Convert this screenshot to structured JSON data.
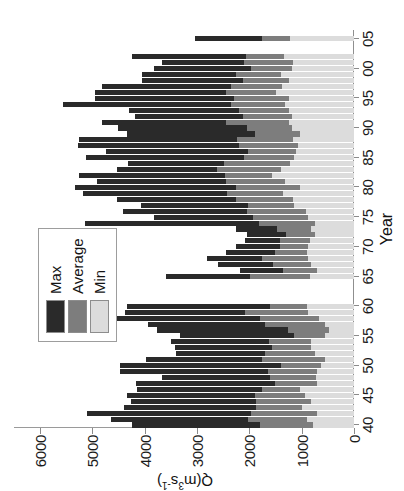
{
  "figure": {
    "ylabel_main": "Q",
    "ylabel_unit_open": "(m",
    "ylabel_exp1": "3",
    "ylabel_s": "s",
    "ylabel_exp2": "-1",
    "ylabel_unit_close": ")",
    "xlabel": "Year"
  },
  "legend": {
    "position": "top-left-inside",
    "items": [
      {
        "label": "Max",
        "color": "#2a2a2a"
      },
      {
        "label": "Average",
        "color": "#7d7d7d"
      },
      {
        "label": "Min",
        "color": "#dcdcdc"
      }
    ]
  },
  "chart_data": {
    "type": "bar",
    "orientation": "rotated-90ccw-horizontal-bars",
    "title": "",
    "subtitle": "",
    "xlabel": "Year",
    "ylabel": "Q (m3 s-1)",
    "ylim": [
      0,
      6500
    ],
    "xlim": [
      1939.5,
      2006.5
    ],
    "grid": false,
    "legend_position": "top-left-inside",
    "ytick_labels": [
      "6000",
      "5000",
      "4000",
      "3000",
      "2000",
      "1000",
      "0"
    ],
    "ytick_values": [
      6000,
      5000,
      4000,
      3000,
      2000,
      1000,
      0
    ],
    "xtick_labels": [
      "40",
      "45",
      "50",
      "55",
      "60",
      "65",
      "70",
      "75",
      "80",
      "85",
      "90",
      "95",
      "00",
      "05"
    ],
    "xtick_values": [
      1940,
      1945,
      1950,
      1955,
      1960,
      1965,
      1970,
      1975,
      1980,
      1985,
      1990,
      1995,
      2000,
      2005
    ],
    "annotations": [
      "data gap for years 1961-1964",
      "no data for 2003-2004 and 2006"
    ],
    "series": [
      {
        "name": "Max",
        "color": "#2a2a2a"
      },
      {
        "name": "Average",
        "color": "#7d7d7d"
      },
      {
        "name": "Min",
        "color": "#dcdcdc"
      }
    ],
    "categories": [
      1940,
      1941,
      1942,
      1943,
      1944,
      1945,
      1946,
      1947,
      1948,
      1949,
      1950,
      1951,
      1952,
      1953,
      1954,
      1955,
      1956,
      1957,
      1958,
      1959,
      1960,
      1965,
      1966,
      1967,
      1968,
      1969,
      1970,
      1971,
      1972,
      1973,
      1974,
      1975,
      1976,
      1977,
      1978,
      1979,
      1980,
      1981,
      1982,
      1983,
      1984,
      1985,
      1986,
      1987,
      1988,
      1989,
      1990,
      1991,
      1992,
      1993,
      1994,
      1995,
      1996,
      1997,
      1998,
      1999,
      2000,
      2001,
      2002,
      2005
    ],
    "records": [
      {
        "year": 1940,
        "max": 4250,
        "avg": 1800,
        "min": 780
      },
      {
        "year": 1941,
        "max": 4640,
        "avg": 2020,
        "min": 900
      },
      {
        "year": 1942,
        "max": 5100,
        "avg": 1960,
        "min": 700
      },
      {
        "year": 1943,
        "max": 4400,
        "avg": 1880,
        "min": 1000
      },
      {
        "year": 1944,
        "max": 4260,
        "avg": 1870,
        "min": 820
      },
      {
        "year": 1945,
        "max": 4340,
        "avg": 1900,
        "min": 940
      },
      {
        "year": 1946,
        "max": 4150,
        "avg": 1760,
        "min": 1030
      },
      {
        "year": 1947,
        "max": 4170,
        "avg": 1520,
        "min": 700
      },
      {
        "year": 1948,
        "max": 3680,
        "avg": 1600,
        "min": 720
      },
      {
        "year": 1949,
        "max": 4480,
        "avg": 1640,
        "min": 700
      },
      {
        "year": 1950,
        "max": 4470,
        "avg": 1400,
        "min": 640
      },
      {
        "year": 1951,
        "max": 3980,
        "avg": 1760,
        "min": 560
      },
      {
        "year": 1952,
        "max": 3400,
        "avg": 1700,
        "min": 740
      },
      {
        "year": 1953,
        "max": 3420,
        "avg": 1560,
        "min": 820
      },
      {
        "year": 1954,
        "max": 3500,
        "avg": 1620,
        "min": 820
      },
      {
        "year": 1955,
        "max": 3320,
        "avg": 1140,
        "min": 560
      },
      {
        "year": 1956,
        "max": 3760,
        "avg": 1260,
        "min": 480
      },
      {
        "year": 1957,
        "max": 3940,
        "avg": 1700,
        "min": 560
      },
      {
        "year": 1958,
        "max": 5060,
        "avg": 1800,
        "min": 660
      },
      {
        "year": 1959,
        "max": 4380,
        "avg": 2080,
        "min": 880
      },
      {
        "year": 1960,
        "max": 4340,
        "avg": 1600,
        "min": 900
      },
      {
        "year": 1965,
        "max": 3600,
        "avg": 1980,
        "min": 840
      },
      {
        "year": 1966,
        "max": 2180,
        "avg": 1360,
        "min": 700
      },
      {
        "year": 1967,
        "max": 2600,
        "avg": 1540,
        "min": 820
      },
      {
        "year": 1968,
        "max": 2820,
        "avg": 1760,
        "min": 880
      },
      {
        "year": 1969,
        "max": 2440,
        "avg": 1520,
        "min": 900
      },
      {
        "year": 1970,
        "max": 2260,
        "avg": 1420,
        "min": 880
      },
      {
        "year": 1971,
        "max": 2080,
        "avg": 1420,
        "min": 840
      },
      {
        "year": 1972,
        "max": 2040,
        "avg": 1300,
        "min": 740
      },
      {
        "year": 1973,
        "max": 2260,
        "avg": 1480,
        "min": 820
      },
      {
        "year": 1974,
        "max": 5140,
        "avg": 1820,
        "min": 740
      },
      {
        "year": 1975,
        "max": 3820,
        "avg": 1940,
        "min": 880
      },
      {
        "year": 1976,
        "max": 4420,
        "avg": 2040,
        "min": 920
      },
      {
        "year": 1977,
        "max": 4080,
        "avg": 2020,
        "min": 1140
      },
      {
        "year": 1978,
        "max": 4540,
        "avg": 2260,
        "min": 1160
      },
      {
        "year": 1979,
        "max": 5180,
        "avg": 2420,
        "min": 1360
      },
      {
        "year": 1980,
        "max": 5340,
        "avg": 2260,
        "min": 1040
      },
      {
        "year": 1981,
        "max": 4920,
        "avg": 2440,
        "min": 1320
      },
      {
        "year": 1982,
        "max": 5260,
        "avg": 2460,
        "min": 1560
      },
      {
        "year": 1983,
        "max": 4540,
        "avg": 2620,
        "min": 1400
      },
      {
        "year": 1984,
        "max": 4320,
        "avg": 2480,
        "min": 1220
      },
      {
        "year": 1985,
        "max": 5120,
        "avg": 2100,
        "min": 1140
      },
      {
        "year": 1986,
        "max": 4740,
        "avg": 2020,
        "min": 1100
      },
      {
        "year": 1987,
        "max": 5280,
        "avg": 2200,
        "min": 1080
      },
      {
        "year": 1988,
        "max": 5260,
        "avg": 2240,
        "min": 1160
      },
      {
        "year": 1989,
        "max": 4340,
        "avg": 1900,
        "min": 1040
      },
      {
        "year": 1990,
        "max": 4520,
        "avg": 2040,
        "min": 1180
      },
      {
        "year": 1991,
        "max": 4820,
        "avg": 2440,
        "min": 1240
      },
      {
        "year": 1992,
        "max": 4180,
        "avg": 2120,
        "min": 1180
      },
      {
        "year": 1993,
        "max": 4300,
        "avg": 2200,
        "min": 1240
      },
      {
        "year": 1994,
        "max": 5560,
        "avg": 2360,
        "min": 1320
      },
      {
        "year": 1995,
        "max": 4960,
        "avg": 2300,
        "min": 1240
      },
      {
        "year": 1996,
        "max": 4960,
        "avg": 2440,
        "min": 1500
      },
      {
        "year": 1997,
        "max": 4820,
        "avg": 2360,
        "min": 1380
      },
      {
        "year": 1998,
        "max": 4060,
        "avg": 2120,
        "min": 1240
      },
      {
        "year": 1999,
        "max": 4060,
        "avg": 2260,
        "min": 1400
      },
      {
        "year": 2000,
        "max": 3820,
        "avg": 1960,
        "min": 1180
      },
      {
        "year": 2001,
        "max": 3680,
        "avg": 2100,
        "min": 1160
      },
      {
        "year": 2002,
        "max": 4240,
        "avg": 2060,
        "min": 1340
      },
      {
        "year": 2005,
        "max": 3040,
        "avg": 1760,
        "min": 1220
      }
    ]
  }
}
